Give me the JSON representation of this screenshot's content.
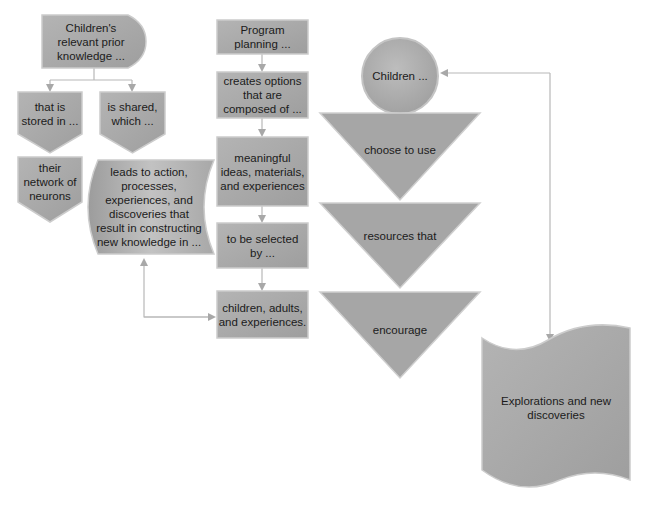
{
  "diagram": {
    "type": "flowchart",
    "colors": {
      "shape_fill": "#a8a8a8",
      "shape_fill_light": "#bdbdbd",
      "shape_edge": "#cfcfcf",
      "connector": "#b5b5b5",
      "text": "#1b1b1b"
    },
    "left_branch": {
      "start": "Children's\nrelevant prior\nknowledge ...",
      "stored": "that is\nstored in ...",
      "shared": "is shared,\nwhich ...",
      "neurons": "their\nnetwork of\nneurons",
      "leads": "leads to action,\nprocesses,\nexperiences, and\ndiscoveries that\nresult in constructing\nnew knowledge in ..."
    },
    "middle_column": {
      "planning": "Program\nplanning ...",
      "options": "creates options\nthat are\ncomposed of ...",
      "meaningful": "meaningful\nideas, materials,\nand experiences",
      "selected": "to be selected\nby ...",
      "children_adults": "children, adults,\nand experiences."
    },
    "right_column": {
      "children": "Children ...",
      "choose": "choose to use",
      "resources": "resources that",
      "encourage": "encourage",
      "explorations": "Explorations and new\ndiscoveries"
    }
  }
}
